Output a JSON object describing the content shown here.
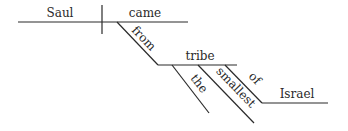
{
  "diagram": {
    "type": "sentence-diagram",
    "sentence_words": [
      "Saul",
      "came",
      "from",
      "the",
      "smallest",
      "tribe",
      "of",
      "Israel"
    ],
    "subject": "Saul",
    "verb": "came",
    "preposition_1": "from",
    "object_1": "tribe",
    "modifier_1": "the",
    "modifier_2": "smallest",
    "preposition_2": "of",
    "object_2": "Israel",
    "line_color": "#2a2a2a",
    "text_color": "#2a2a2a"
  }
}
